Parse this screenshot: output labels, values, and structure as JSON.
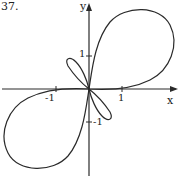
{
  "problem": {
    "number": "37."
  },
  "axes": {
    "x_label": "x",
    "y_label": "y",
    "x_ticks": [
      "-1",
      "1"
    ],
    "y_ticks": [
      "1",
      "-1"
    ]
  },
  "figure": {
    "stroke_color": "#2a2a2a"
  }
}
